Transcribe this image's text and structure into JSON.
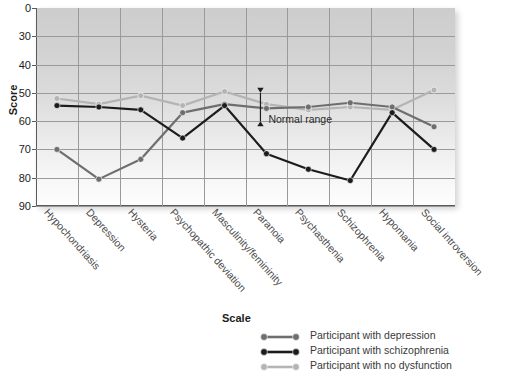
{
  "chart_data": {
    "type": "line",
    "title": "",
    "xlabel": "",
    "ylabel": "Score",
    "legend_title": "Scale",
    "legend_position": "bottom",
    "grid": true,
    "ylim": [
      0,
      90
    ],
    "yticks": [
      0,
      30,
      40,
      50,
      60,
      70,
      80,
      90
    ],
    "y_axis_broken_between": [
      0,
      30
    ],
    "categories": [
      "Hypochondriasis",
      "Depression",
      "Hysteria",
      "Psychopathic deviation",
      "Masculinity/femininity",
      "Paranoia",
      "Psychasthenia",
      "Schizophrenia",
      "Hypomania",
      "Social introversion"
    ],
    "series": [
      {
        "name": "Participant with depression",
        "color": "#6e6e6e",
        "values": [
          70,
          80.5,
          73.5,
          57,
          54,
          55.5,
          55,
          53.5,
          55,
          62
        ]
      },
      {
        "name": "Participant with schizophrenia",
        "color": "#1c1c1c",
        "values": [
          54.5,
          55,
          56,
          66,
          54.5,
          71.5,
          77,
          81,
          57,
          70
        ]
      },
      {
        "name": "Participant with no dysfunction",
        "color": "#b4b4b4",
        "values": [
          52,
          54,
          51,
          54.5,
          49.5,
          54,
          56,
          55,
          56,
          49
        ]
      }
    ],
    "annotations": [
      {
        "text": "Normal range",
        "type": "double-arrow",
        "range": [
          50,
          60
        ],
        "at_category": "Paranoia"
      }
    ]
  },
  "legend": {
    "title": "Scale",
    "items": [
      {
        "label": "Participant with depression",
        "color": "#6e6e6e"
      },
      {
        "label": "Participant with schizophrenia",
        "color": "#1c1c1c"
      },
      {
        "label": "Participant with no dysfunction",
        "color": "#b4b4b4"
      }
    ]
  },
  "axis": {
    "y_title": "Score"
  }
}
